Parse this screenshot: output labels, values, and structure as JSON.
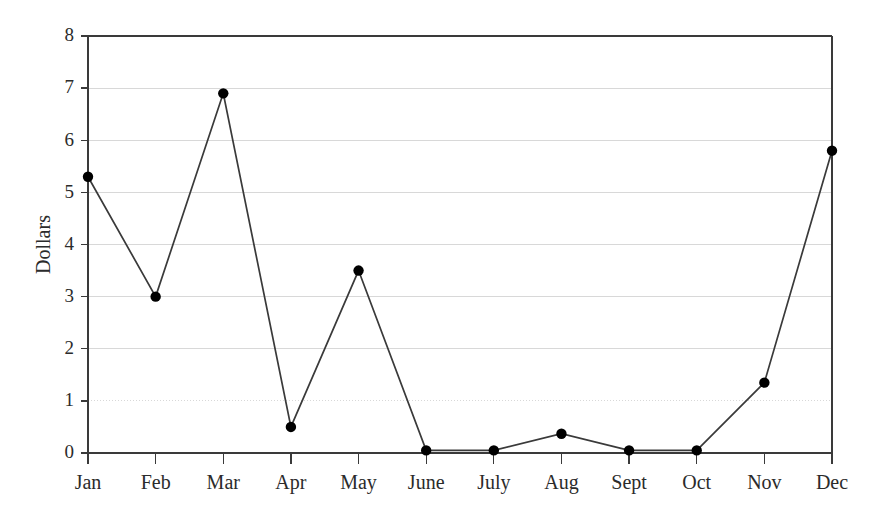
{
  "chart_data": {
    "type": "line",
    "title": "",
    "subtitle": "",
    "xlabel": "",
    "ylabel": "Dollars",
    "categories": [
      "Jan",
      "Feb",
      "Mar",
      "Apr",
      "May",
      "June",
      "July",
      "Aug",
      "Sept",
      "Oct",
      "Nov",
      "Dec"
    ],
    "series": [
      {
        "name": "Dollars",
        "values": [
          5.3,
          3.0,
          6.9,
          0.5,
          3.5,
          0.05,
          0.05,
          0.37,
          0.05,
          0.05,
          1.35,
          5.8
        ],
        "line_color": "#3a3a3a",
        "marker_color": "#000000",
        "marker": "circle"
      }
    ],
    "ylim": [
      0,
      8
    ],
    "xlim": [
      0,
      11
    ],
    "ytick_labels": [
      "0",
      "1",
      "2",
      "3",
      "4",
      "5",
      "6",
      "7",
      "8"
    ],
    "ytick_values": [
      0,
      1,
      2,
      3,
      4,
      5,
      6,
      7,
      8
    ],
    "grid": true,
    "grid_axis": "y",
    "grid_color": "#d8d8d8",
    "axis_color": "#3a3a3a",
    "legend": false,
    "legend_position": "none",
    "background": "#ffffff",
    "annotations": []
  },
  "plot_geometry": {
    "left": 88,
    "right": 832,
    "top": 36,
    "bottom": 453
  }
}
